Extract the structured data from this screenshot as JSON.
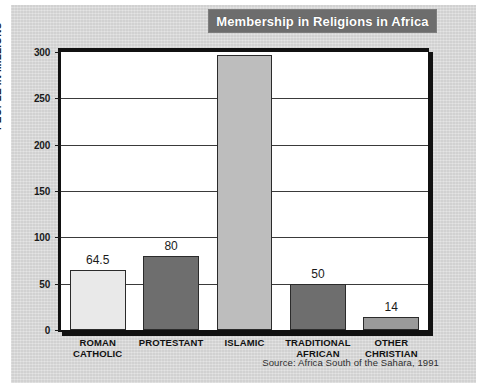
{
  "figure": {
    "title": "Membership in Religions in Africa",
    "source": "Source: Africa South of the Sahara, 1991",
    "panel_color": "#d9d9d9",
    "title_banner_color": "#6d6d6d",
    "title_text_color": "#ffffff",
    "plot_background": "#ffffff",
    "axis_color": "#111111"
  },
  "chart_data": {
    "type": "bar",
    "title": "Membership in Religions in Africa",
    "xlabel": "",
    "ylabel": "PEOPLE IN MILLIONS",
    "ylim": [
      0,
      300
    ],
    "yticks": [
      0,
      50,
      100,
      150,
      200,
      250,
      300
    ],
    "ytick_labels": [
      "0",
      "50",
      "100",
      "150",
      "200",
      "250",
      "300"
    ],
    "grid": true,
    "legend": false,
    "categories": [
      "ROMAN CATHOLIC",
      "PROTESTANT",
      "ISLAMIC",
      "TRADITIONAL AFRICAN",
      "OTHER CHRISTIAN"
    ],
    "category_lines": [
      [
        "ROMAN",
        "CATHOLIC"
      ],
      [
        "PROTESTANT"
      ],
      [
        "ISLAMIC"
      ],
      [
        "TRADITIONAL",
        "AFRICAN"
      ],
      [
        "OTHER",
        "CHRISTIAN"
      ]
    ],
    "values": [
      64.5,
      80,
      297,
      50,
      14
    ],
    "value_labels": [
      "64.5",
      "80",
      "",
      "50",
      "14"
    ],
    "bar_colors": [
      "#e9e9e9",
      "#6e6e6e",
      "#bdbdbd",
      "#6e6e6e",
      "#9a9a9a"
    ],
    "bar_edge_color": "#2b2b2b"
  }
}
